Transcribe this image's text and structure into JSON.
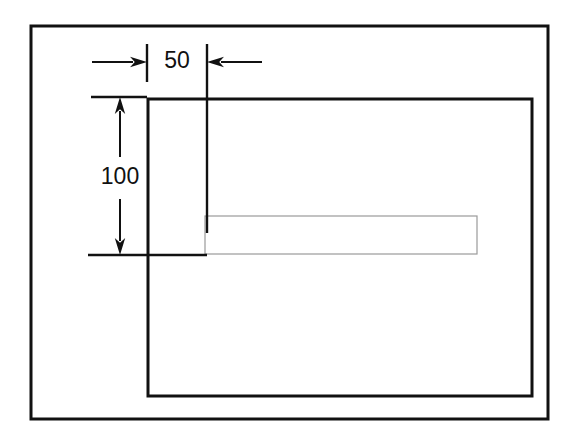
{
  "diagram": {
    "type": "engineering-dimension-drawing",
    "background_color": "#ffffff",
    "stroke_color": "#111111",
    "thin_stroke_color": "#9a9a9a",
    "outer_frame": {
      "name": "outer-border-frame",
      "x": 31,
      "y": 26,
      "width": 517,
      "height": 393,
      "stroke_width": 3
    },
    "inner_rect": {
      "name": "inner-main-rectangle",
      "x": 148,
      "y": 99,
      "width": 384,
      "height": 297,
      "stroke_width": 3
    },
    "thin_rect": {
      "name": "thin-slot-rectangle",
      "x": 205,
      "y": 216,
      "width": 272,
      "height": 38,
      "stroke_width": 1.2
    },
    "dimensions": [
      {
        "id": "horizontal-offset",
        "label": "50",
        "orientation": "horizontal",
        "value": 50,
        "label_x": 177,
        "label_y": 62,
        "line_y": 62,
        "left_extension_x": 147,
        "right_extension_x": 207,
        "left_arrow_tail_x": 92,
        "right_arrow_tail_x": 262,
        "arrow_direction": "inward",
        "extension_top_y": 44,
        "extension_bottom_y": 82
      },
      {
        "id": "vertical-offset",
        "label": "100",
        "orientation": "vertical",
        "value": 100,
        "label_x": 120,
        "label_y": 178,
        "line_x": 120,
        "top_extension_y": 97,
        "bottom_extension_y": 255,
        "arrow_direction": "outward",
        "top_extension_line": {
          "x1": 91,
          "x2": 147
        },
        "bottom_extension_line": {
          "x1": 88,
          "x2": 207
        }
      }
    ]
  }
}
